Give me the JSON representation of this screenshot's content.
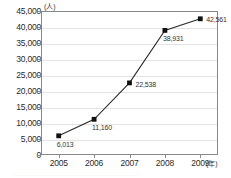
{
  "chart_data": {
    "type": "line",
    "title": "",
    "subtitle": "",
    "xlabel": "(年)",
    "ylabel": "(人)",
    "categories": [
      "2005",
      "2006",
      "2007",
      "2008",
      "2009"
    ],
    "values": [
      6013,
      11160,
      22538,
      38931,
      42561
    ],
    "point_labels": [
      "6,013",
      "11,160",
      "22,538",
      "38,931",
      "42,561"
    ],
    "series": [
      {
        "name": "",
        "values": [
          6013,
          11160,
          22538,
          38931,
          42561
        ],
        "marker": "square",
        "color": "#1a1a1a"
      }
    ],
    "ylim": [
      0,
      45000
    ],
    "ytick_values": [
      0,
      5000,
      10000,
      15000,
      20000,
      25000,
      30000,
      35000,
      40000,
      45000
    ],
    "ytick_labels": [
      "0",
      "5,000",
      "10,000",
      "15,000",
      "20,000",
      "25,000",
      "30,000",
      "35,000",
      "40,000",
      "45,000"
    ],
    "xtick_labels": [
      "2005",
      "2006",
      "2007",
      "2008",
      "2009"
    ],
    "grid": "horizontal",
    "legend": "none",
    "line_color": "#2b2b2b",
    "marker_color": "#111111",
    "grid_color": "#e2e2e2",
    "frame_color": "#8a8a8a",
    "background": "#ffffff"
  },
  "axis": {
    "y_unit": "(人)",
    "x_unit": "(年)"
  },
  "caption": {
    "cutoff_text": "………………………………………………………"
  }
}
